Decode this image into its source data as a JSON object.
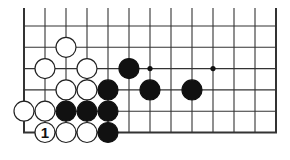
{
  "board": {
    "columns": 13,
    "rows": 6,
    "origin_x": 24,
    "origin_y": 26,
    "spacing_x": 21,
    "spacing_y": 21.3,
    "top_extend_y": 8,
    "edges": [
      "left",
      "bottom",
      "right"
    ],
    "line_color": "#333333",
    "hoshi": [
      [
        6,
        2
      ],
      [
        9,
        2
      ]
    ]
  },
  "stones": [
    {
      "color": "white",
      "col": 2,
      "row": 1
    },
    {
      "color": "white",
      "col": 1,
      "row": 2
    },
    {
      "color": "white",
      "col": 3,
      "row": 2
    },
    {
      "color": "black",
      "col": 5,
      "row": 2
    },
    {
      "color": "white",
      "col": 2,
      "row": 3
    },
    {
      "color": "white",
      "col": 3,
      "row": 3
    },
    {
      "color": "black",
      "col": 4,
      "row": 3
    },
    {
      "color": "black",
      "col": 6,
      "row": 3
    },
    {
      "color": "black",
      "col": 8,
      "row": 3
    },
    {
      "color": "white",
      "col": 0,
      "row": 4
    },
    {
      "color": "white",
      "col": 1,
      "row": 4
    },
    {
      "color": "black",
      "col": 2,
      "row": 4
    },
    {
      "color": "black",
      "col": 3,
      "row": 4
    },
    {
      "color": "black",
      "col": 4,
      "row": 4
    },
    {
      "color": "white",
      "col": 1,
      "row": 5,
      "label": "1"
    },
    {
      "color": "white",
      "col": 2,
      "row": 5
    },
    {
      "color": "white",
      "col": 3,
      "row": 5
    },
    {
      "color": "black",
      "col": 4,
      "row": 5
    }
  ],
  "move_label": "1"
}
